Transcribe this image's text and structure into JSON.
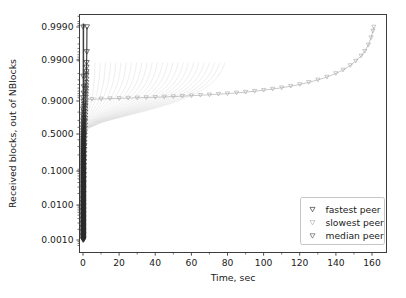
{
  "chart_data": {
    "type": "line",
    "title": "",
    "xlabel": "Time, sec",
    "ylabel": "Received blocks, out of NBlocks",
    "yscale": "logit",
    "xlim": [
      -5,
      168
    ],
    "ylim": [
      0.0006,
      0.99955
    ],
    "grid": false,
    "legend_position": "lower right",
    "xticks": [
      0,
      20,
      40,
      60,
      80,
      100,
      120,
      140,
      160
    ],
    "xticklabels": [
      "0",
      "20",
      "40",
      "60",
      "80",
      "100",
      "120",
      "140",
      "160"
    ],
    "yticks": [
      0.999,
      0.99,
      0.9,
      0.5,
      0.1,
      0.01,
      0.001
    ],
    "yticklabels": [
      "0.9990",
      "0.9900",
      "0.9000",
      "0.5000",
      "0.1000",
      "0.0100",
      "0.0010"
    ],
    "marker": "triangle-down",
    "series": [
      {
        "name": "fastest peer",
        "color": "#2b2b2b",
        "x": [
          0.05,
          0.06,
          0.07,
          0.08,
          0.09,
          0.1,
          0.12,
          0.14,
          0.16,
          0.18,
          0.2,
          0.24,
          0.28,
          0.32,
          0.36,
          0.4,
          0.45,
          0.5,
          0.55,
          0.6,
          0.65,
          0.7,
          0.75,
          0.8,
          0.85,
          0.9,
          0.95,
          1.0,
          1.05,
          1.1,
          1.15,
          1.2,
          1.25,
          1.3,
          1.35,
          1.4,
          1.45,
          1.5,
          1.55,
          1.6,
          1.65,
          1.7,
          1.75,
          1.8,
          1.85,
          1.9,
          1.95,
          2.0,
          2.1,
          2.2
        ],
        "y": [
          0.001,
          0.0013,
          0.0017,
          0.0022,
          0.0029,
          0.0038,
          0.005,
          0.0066,
          0.0087,
          0.011,
          0.014,
          0.02,
          0.028,
          0.038,
          0.05,
          0.065,
          0.085,
          0.11,
          0.14,
          0.175,
          0.215,
          0.26,
          0.31,
          0.36,
          0.415,
          0.47,
          0.525,
          0.58,
          0.63,
          0.68,
          0.725,
          0.765,
          0.8,
          0.83,
          0.855,
          0.878,
          0.896,
          0.912,
          0.925,
          0.937,
          0.947,
          0.956,
          0.964,
          0.971,
          0.977,
          0.982,
          0.9865,
          0.99,
          0.995,
          0.999
        ]
      },
      {
        "name": "slowest peer",
        "color": "#9a9a9a",
        "x": [
          1.0,
          5,
          10,
          15,
          20,
          25,
          30,
          35,
          40,
          45,
          50,
          55,
          60,
          65,
          70,
          75,
          80,
          85,
          90,
          95,
          100,
          105,
          110,
          115,
          120,
          125,
          130,
          135,
          140,
          144,
          148,
          151,
          154,
          156,
          158,
          159.5,
          160.5,
          161
        ],
        "y": [
          0.9,
          0.902,
          0.904,
          0.9055,
          0.907,
          0.9085,
          0.91,
          0.9115,
          0.913,
          0.9148,
          0.9165,
          0.9185,
          0.9205,
          0.9228,
          0.925,
          0.9275,
          0.93,
          0.933,
          0.936,
          0.9395,
          0.943,
          0.947,
          0.951,
          0.9555,
          0.96,
          0.965,
          0.97,
          0.975,
          0.98,
          0.984,
          0.988,
          0.991,
          0.9935,
          0.9952,
          0.9968,
          0.998,
          0.9987,
          0.999
        ]
      },
      {
        "name": "median peer",
        "color": "#555555",
        "x": [
          0.8,
          1.0,
          1.2,
          1.5,
          1.8,
          2.0
        ],
        "y": [
          0.3,
          0.5,
          0.7,
          0.86,
          0.95,
          0.98
        ]
      }
    ],
    "legend_entries": [
      {
        "label": "fastest peer",
        "marker": "triangle-down",
        "color": "#2b2b2b"
      },
      {
        "label": "slowest peer",
        "marker": "triangle-down",
        "color": "#b0b0b0"
      },
      {
        "label": "median peer",
        "marker": "triangle-down",
        "color": "#555555"
      }
    ]
  },
  "axes": {
    "x_title": "Time, sec",
    "y_title": "Received blocks, out of NBlocks",
    "x_ticks": [
      {
        "label": "0",
        "px": 83
      },
      {
        "label": "20",
        "px": 119.1
      },
      {
        "label": "40",
        "px": 155.2
      },
      {
        "label": "60",
        "px": 191.4
      },
      {
        "label": "80",
        "px": 227.5
      },
      {
        "label": "100",
        "px": 263.6
      },
      {
        "label": "120",
        "px": 299.7
      },
      {
        "label": "140",
        "px": 335.9
      },
      {
        "label": "160",
        "px": 372
      }
    ],
    "y_ticks": [
      {
        "label": "0.9990",
        "px": 27
      },
      {
        "label": "0.9900",
        "px": 60
      },
      {
        "label": "0.9000",
        "px": 101
      },
      {
        "label": "0.5000",
        "px": 134
      },
      {
        "label": "0.1000",
        "px": 171
      },
      {
        "label": "0.0100",
        "px": 205
      },
      {
        "label": "0.0010",
        "px": 240
      }
    ]
  },
  "legend": {
    "items": [
      {
        "label": "fastest peer"
      },
      {
        "label": "slowest peer"
      },
      {
        "label": "median peer"
      }
    ]
  },
  "colors": {
    "frame": "#3d3d3d",
    "text": "#1a1a1a",
    "fastest": "#2b2b2b",
    "slowest": "#9a9a9a",
    "median": "#555555",
    "faint": "#dedede",
    "background": "#ffffff"
  }
}
